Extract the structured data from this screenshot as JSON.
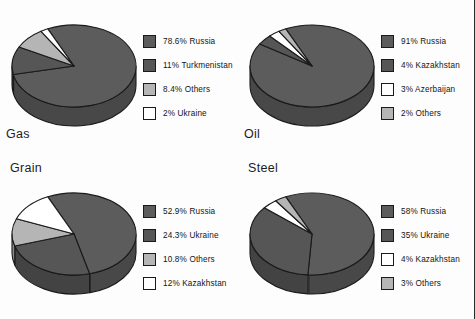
{
  "colors": {
    "slice_primary": "#5c5c5c",
    "slice_secondary": "#565656",
    "slice_light": "#b5b5b5",
    "slice_white": "#ffffff",
    "outline": "#1a1a1a",
    "page_background": "#fdfdfd",
    "text": "#1a1a1a"
  },
  "chart_data": [
    {
      "type": "pie",
      "title": "Gas",
      "title_position": "below",
      "categories": [
        "Russia",
        "Turkmenistan",
        "Others",
        "Ukraine"
      ],
      "values": [
        78.6,
        11,
        8.4,
        2
      ],
      "legend_position": "right",
      "legend": [
        {
          "label": "78.6% Russia",
          "value": 78.6,
          "name": "Russia",
          "color": "#5c5c5c"
        },
        {
          "label": "11% Turkmenistan",
          "value": 11,
          "name": "Turkmenistan",
          "color": "#565656"
        },
        {
          "label": "8.4% Others",
          "value": 8.4,
          "name": "Others",
          "color": "#b5b5b5"
        },
        {
          "label": "2% Ukraine",
          "value": 2,
          "name": "Ukraine",
          "color": "#ffffff"
        }
      ]
    },
    {
      "type": "pie",
      "title": "Oil",
      "title_position": "below",
      "categories": [
        "Russia",
        "Kazakhstan",
        "Azerbaijan",
        "Others"
      ],
      "values": [
        91,
        4,
        3,
        2
      ],
      "legend_position": "right",
      "legend": [
        {
          "label": "91% Russia",
          "value": 91,
          "name": "Russia",
          "color": "#5c5c5c"
        },
        {
          "label": "4% Kazakhstan",
          "value": 4,
          "name": "Kazakhstan",
          "color": "#565656"
        },
        {
          "label": "3% Azerbaijan",
          "value": 3,
          "name": "Azerbaijan",
          "color": "#ffffff"
        },
        {
          "label": "2% Others",
          "value": 2,
          "name": "Others",
          "color": "#b5b5b5"
        }
      ]
    },
    {
      "type": "pie",
      "title": "Grain",
      "title_position": "above",
      "categories": [
        "Russia",
        "Ukraine",
        "Others",
        "Kazakhstan"
      ],
      "values": [
        52.9,
        24.3,
        10.8,
        12
      ],
      "legend_position": "right",
      "legend": [
        {
          "label": "52.9% Russia",
          "value": 52.9,
          "name": "Russia",
          "color": "#5c5c5c"
        },
        {
          "label": "24.3% Ukraine",
          "value": 24.3,
          "name": "Ukraine",
          "color": "#565656"
        },
        {
          "label": "10.8% Others",
          "value": 10.8,
          "name": "Others",
          "color": "#b5b5b5"
        },
        {
          "label": "12% Kazakhstan",
          "value": 12,
          "name": "Kazakhstan",
          "color": "#ffffff"
        }
      ]
    },
    {
      "type": "pie",
      "title": "Steel",
      "title_position": "above",
      "categories": [
        "Russia",
        "Ukraine",
        "Kazakhstan",
        "Others"
      ],
      "values": [
        58,
        35,
        4,
        3
      ],
      "legend_position": "right",
      "legend": [
        {
          "label": "58% Russia",
          "value": 58,
          "name": "Russia",
          "color": "#5c5c5c"
        },
        {
          "label": "35% Ukraine",
          "value": 35,
          "name": "Ukraine",
          "color": "#565656"
        },
        {
          "label": "4% Kazakhstan",
          "value": 4,
          "name": "Kazakhstan",
          "color": "#ffffff"
        },
        {
          "label": "3% Others",
          "value": 3,
          "name": "Others",
          "color": "#b5b5b5"
        }
      ]
    }
  ]
}
